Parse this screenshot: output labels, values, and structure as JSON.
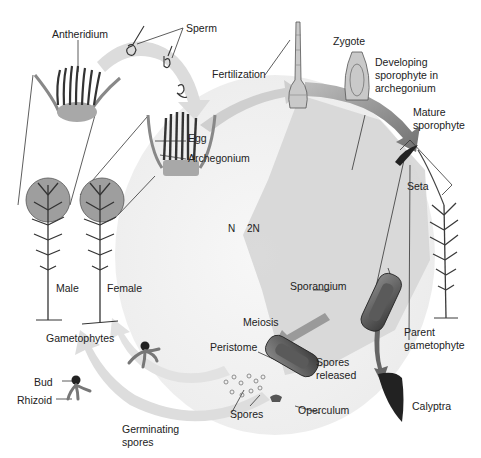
{
  "diagram": {
    "labels": {
      "antheridium": "Antheridium",
      "sperm": "Sperm",
      "fertilization": "Fertilization",
      "zygote": "Zygote",
      "developing_sporophyte_line1": "Developing",
      "developing_sporophyte_line2": "sporophyte in",
      "developing_sporophyte_line3": "archegonium",
      "egg": "Egg",
      "archegonium": "Archegonium",
      "mature_sporophyte_line1": "Mature",
      "mature_sporophyte_line2": "sporophyte",
      "seta": "Seta",
      "haploid": "N",
      "diploid": "2N",
      "male": "Male",
      "female": "Female",
      "sporangium": "Sporangium",
      "meiosis": "Meiosis",
      "gametophytes": "Gametophytes",
      "peristome": "Peristome",
      "spores_released_line1": "Spores",
      "spores_released_line2": "released",
      "parent_gametophyte_line1": "Parent",
      "parent_gametophyte_line2": "gametophyte",
      "bud": "Bud",
      "rhizoid": "Rhizoid",
      "spores": "Spores",
      "operculum": "Operculum",
      "calyptra": "Calyptra",
      "germinating_spores_line1": "Germinating",
      "germinating_spores_line2": "spores"
    },
    "colors": {
      "background": "#ffffff",
      "haploid_region": "#f1f1f1",
      "diploid_region": "#d9d9d9",
      "cycle_arrow": "#c8c8c8",
      "dark_arrow": "#7a7a7a",
      "plant_stroke": "#3a3a3a",
      "magnifier_fill": "#9a9a9a",
      "leader_line": "#222222",
      "text": "#222222"
    }
  }
}
